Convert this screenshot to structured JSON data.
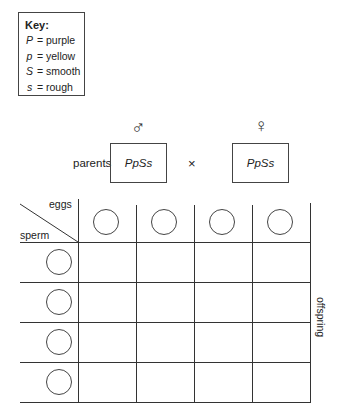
{
  "key": {
    "title": "Key:",
    "items": [
      {
        "symbol": "P",
        "eq": "=",
        "meaning": "purple"
      },
      {
        "symbol": "p",
        "eq": "=",
        "meaning": "yellow"
      },
      {
        "symbol": "S",
        "eq": "=",
        "meaning": "smooth"
      },
      {
        "symbol": "s",
        "eq": "=",
        "meaning": "rough"
      }
    ]
  },
  "cross": {
    "parents_label": "parents",
    "male_symbol": "♂",
    "female_symbol": "♀",
    "male_genotype": "PpSs",
    "female_genotype": "PpSs",
    "cross_symbol": "×"
  },
  "punnett": {
    "eggs_label": "eggs",
    "sperm_label": "sperm",
    "offspring_label": "offspring",
    "egg_columns": 4,
    "sperm_rows": 4,
    "egg_gametes": [
      "",
      "",
      "",
      ""
    ],
    "sperm_gametes": [
      "",
      "",
      "",
      ""
    ],
    "cells": [
      [
        "",
        "",
        "",
        ""
      ],
      [
        "",
        "",
        "",
        ""
      ],
      [
        "",
        "",
        "",
        ""
      ],
      [
        "",
        "",
        "",
        ""
      ]
    ]
  }
}
